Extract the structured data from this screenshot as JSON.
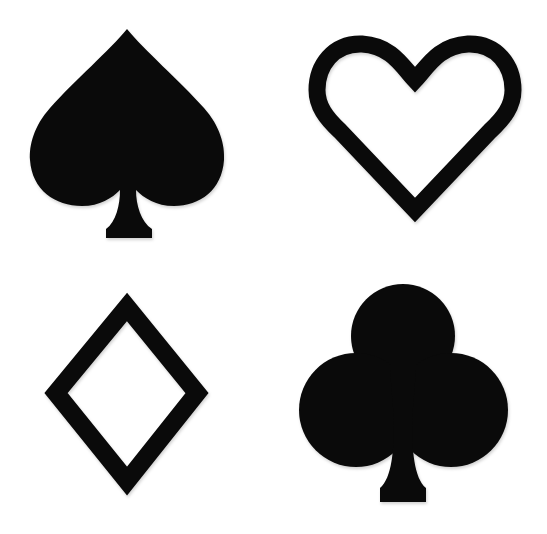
{
  "title": "Card suit icons",
  "colors": {
    "background": "#ffffff",
    "ink": "#0a0a0a"
  },
  "suits": [
    {
      "id": "spade",
      "label": "Spade",
      "style": "filled",
      "position": "top-left"
    },
    {
      "id": "heart",
      "label": "Heart",
      "style": "outline",
      "position": "top-right"
    },
    {
      "id": "diamond",
      "label": "Diamond",
      "style": "outline",
      "position": "bottom-left"
    },
    {
      "id": "club",
      "label": "Club",
      "style": "filled",
      "position": "bottom-right"
    }
  ]
}
